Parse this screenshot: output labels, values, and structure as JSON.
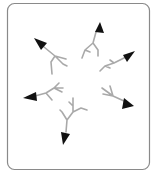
{
  "diagram": {
    "type": "radial-arrows",
    "frame": {
      "stroke": "#8a8a8a",
      "fill": "#ffffff"
    },
    "colors": {
      "branch": "#a9a9a9",
      "arrowhead": "#111111"
    },
    "arrows": [
      {
        "id": "arrow-nw",
        "direction": "north-west"
      },
      {
        "id": "arrow-n",
        "direction": "north"
      },
      {
        "id": "arrow-ne",
        "direction": "north-east"
      },
      {
        "id": "arrow-se",
        "direction": "south-east"
      },
      {
        "id": "arrow-s",
        "direction": "south"
      },
      {
        "id": "arrow-w",
        "direction": "west"
      }
    ]
  }
}
